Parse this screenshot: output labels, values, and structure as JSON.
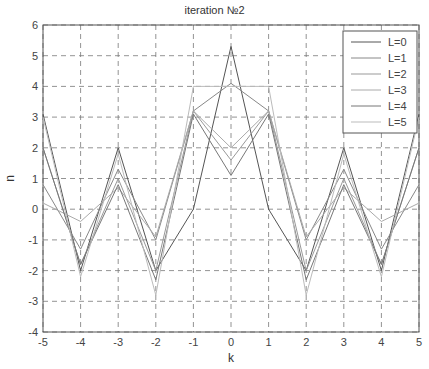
{
  "chart_data": {
    "type": "line",
    "title": "iteration №2",
    "xlabel": "k",
    "ylabel": "n",
    "xlim": [
      -5,
      5
    ],
    "ylim": [
      -4,
      6
    ],
    "x": [
      -5,
      -4,
      -3,
      -2,
      -1,
      0,
      1,
      2,
      3,
      4,
      5
    ],
    "xticks": [
      "-5",
      "-4",
      "-3",
      "-2",
      "-1",
      "0",
      "1",
      "2",
      "3",
      "4",
      "5"
    ],
    "yticks": [
      "-4",
      "-3",
      "-2",
      "-1",
      "0",
      "1",
      "2",
      "3",
      "4",
      "5",
      "6"
    ],
    "grid": true,
    "legend_position": "upper right",
    "series": [
      {
        "name": "L=0",
        "color": "#555555",
        "values": [
          3.1,
          -2.0,
          2.0,
          -2.0,
          0.0,
          5.3,
          0.0,
          -2.0,
          2.0,
          -2.0,
          3.1
        ]
      },
      {
        "name": "L=1",
        "color": "#888888",
        "values": [
          0.8,
          -1.3,
          1.3,
          -1.0,
          3.2,
          4.1,
          3.2,
          -1.0,
          1.3,
          -1.3,
          0.8
        ]
      },
      {
        "name": "L=2",
        "color": "#999999",
        "values": [
          2.0,
          -1.8,
          1.0,
          -2.0,
          3.2,
          1.6,
          3.2,
          -2.0,
          1.0,
          -1.8,
          2.0
        ]
      },
      {
        "name": "L=3",
        "color": "#aaaaaa",
        "values": [
          0.2,
          -0.4,
          0.7,
          -0.9,
          3.2,
          2.0,
          3.2,
          -0.9,
          0.7,
          -0.4,
          0.2
        ]
      },
      {
        "name": "L=4",
        "color": "#777777",
        "values": [
          2.0,
          -1.8,
          0.8,
          -2.3,
          3.1,
          1.1,
          3.1,
          -2.3,
          0.8,
          -1.8,
          2.0
        ]
      },
      {
        "name": "L=5",
        "color": "#bbbbbb",
        "values": [
          3.0,
          -2.2,
          1.8,
          -2.8,
          4.0,
          4.0,
          4.0,
          -2.8,
          1.8,
          -2.2,
          3.0
        ]
      }
    ]
  }
}
